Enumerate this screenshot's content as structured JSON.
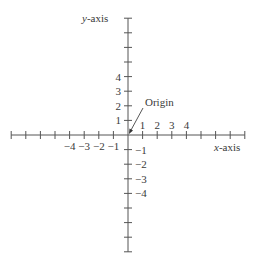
{
  "diagram": {
    "origin": {
      "x": 128,
      "y": 135
    },
    "unit_px": 14.6,
    "x_axis": {
      "label_prefix": "x",
      "label_suffix": "-axis",
      "ticks_min": -8,
      "ticks_max": 8,
      "labels": [
        {
          "value": -4,
          "text": "−4"
        },
        {
          "value": -3,
          "text": "−3"
        },
        {
          "value": -2,
          "text": "−2"
        },
        {
          "value": -1,
          "text": "−1"
        },
        {
          "value": 1,
          "text": "1"
        },
        {
          "value": 2,
          "text": "2"
        },
        {
          "value": 3,
          "text": "3"
        },
        {
          "value": 4,
          "text": "4"
        }
      ]
    },
    "y_axis": {
      "label_prefix": "y",
      "label_suffix": "-axis",
      "ticks_min": -8,
      "ticks_max": 8,
      "labels": [
        {
          "value": 4,
          "text": "4"
        },
        {
          "value": 3,
          "text": "3"
        },
        {
          "value": 2,
          "text": "2"
        },
        {
          "value": 1,
          "text": "1"
        },
        {
          "value": -1,
          "text": "−1"
        },
        {
          "value": -2,
          "text": "−2"
        },
        {
          "value": -3,
          "text": "−3"
        },
        {
          "value": -4,
          "text": "−4"
        }
      ]
    },
    "origin_annotation": {
      "text": "Origin"
    },
    "colors": {
      "axis": "#555555",
      "text": "#3a3a3a",
      "background": "#ffffff"
    }
  }
}
